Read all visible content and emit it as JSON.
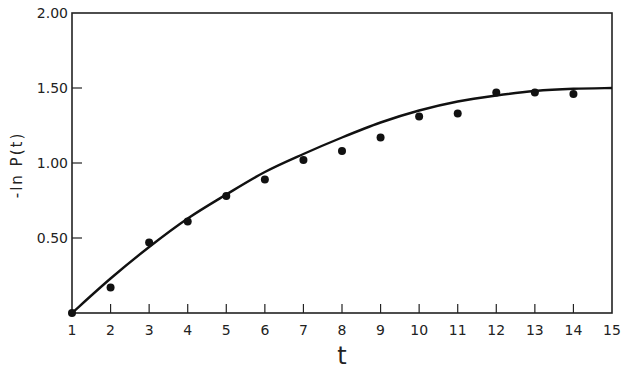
{
  "chart_data": {
    "type": "scatter",
    "title": "",
    "xlabel": "t",
    "ylabel": "-ln P(t)",
    "xlim": [
      1,
      15
    ],
    "ylim": [
      0,
      2.0
    ],
    "x_ticks": [
      1,
      2,
      3,
      4,
      5,
      6,
      7,
      8,
      9,
      10,
      11,
      12,
      13,
      14,
      15
    ],
    "y_ticks": [
      0.5,
      1.0,
      1.5,
      2.0
    ],
    "y_tick_labels": [
      "0.50",
      "1.00",
      "1.50",
      "2.00"
    ],
    "grid": false,
    "legend": null,
    "series": [
      {
        "name": "observed",
        "type": "scatter",
        "x": [
          1,
          2,
          3,
          4,
          5,
          6,
          7,
          8,
          9,
          10,
          11,
          12,
          13,
          14
        ],
        "y": [
          0.0,
          0.17,
          0.47,
          0.61,
          0.78,
          0.89,
          1.02,
          1.08,
          1.17,
          1.31,
          1.33,
          1.47,
          1.47,
          1.46
        ]
      },
      {
        "name": "fitted curve",
        "type": "line",
        "x": [
          1,
          2,
          3,
          4,
          5,
          6,
          7,
          8,
          9,
          10,
          11,
          12,
          13,
          14,
          15
        ],
        "y": [
          0.0,
          0.23,
          0.44,
          0.63,
          0.79,
          0.94,
          1.06,
          1.17,
          1.27,
          1.35,
          1.41,
          1.45,
          1.48,
          1.495,
          1.5
        ]
      }
    ]
  }
}
